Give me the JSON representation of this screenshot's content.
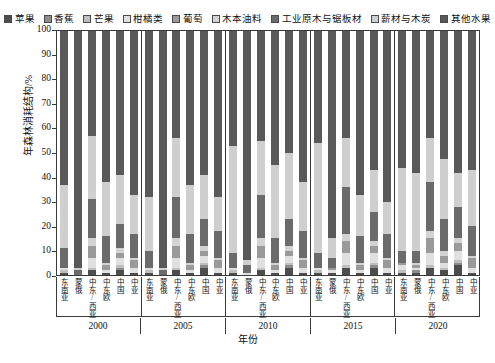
{
  "chart_data": {
    "type": "bar",
    "subtype": "100% stacked column",
    "title": "",
    "xlabel": "年份",
    "ylabel": "年森林消耗结构/%",
    "ylim": [
      0,
      100
    ],
    "yticks": [
      0,
      10,
      20,
      30,
      40,
      50,
      60,
      70,
      80,
      90,
      100
    ],
    "grid": false,
    "legend_position": "top",
    "groups": [
      "2000",
      "2005",
      "2010",
      "2015",
      "2020"
    ],
    "categories": [
      "东南亚",
      "蒙俄",
      "中东/西亚",
      "中东欧",
      "中国",
      "中亚"
    ],
    "series": [
      {
        "name": "苹果",
        "color": "#4d4d4d"
      },
      {
        "name": "香蕉",
        "color": "#8c8c8c"
      },
      {
        "name": "芒果",
        "color": "#bfbfbf"
      },
      {
        "name": "柑橘类",
        "color": "#e0e0e0"
      },
      {
        "name": "葡萄",
        "color": "#9a9a9a"
      },
      {
        "name": "木本油料",
        "color": "#d3d3d3"
      },
      {
        "name": "工业原木与锯板材",
        "color": "#6b6b6b"
      },
      {
        "name": "薪材与木炭",
        "color": "#cfcfcf"
      },
      {
        "name": "其他水果",
        "color": "#595959"
      }
    ],
    "values": {
      "2000": {
        "东南亚": [
          1,
          0,
          1,
          1,
          0,
          0,
          8,
          26,
          63
        ],
        "蒙俄": [
          0,
          0,
          0,
          0,
          0,
          0,
          2,
          1,
          97
        ],
        "中东/西亚": [
          2,
          0,
          1,
          4,
          5,
          3,
          16,
          26,
          43
        ],
        "中东欧": [
          1,
          0,
          0,
          1,
          2,
          1,
          11,
          22,
          62
        ],
        "中国": [
          2,
          1,
          1,
          3,
          2,
          2,
          10,
          20,
          59
        ],
        "中亚": [
          1,
          0,
          0,
          2,
          3,
          1,
          10,
          16,
          67
        ]
      },
      "2005": {
        "东南亚": [
          1,
          0,
          1,
          1,
          0,
          0,
          7,
          22,
          68
        ],
        "蒙俄": [
          0,
          0,
          0,
          0,
          0,
          0,
          2,
          1,
          97
        ],
        "中东/西亚": [
          2,
          0,
          1,
          4,
          5,
          3,
          17,
          24,
          44
        ],
        "中东欧": [
          1,
          0,
          0,
          1,
          2,
          1,
          12,
          20,
          63
        ],
        "中国": [
          3,
          1,
          1,
          3,
          2,
          2,
          11,
          18,
          59
        ],
        "中亚": [
          1,
          0,
          0,
          2,
          3,
          1,
          11,
          14,
          68
        ]
      },
      "2010": {
        "东南亚": [
          1,
          0,
          1,
          1,
          0,
          0,
          6,
          44,
          47
        ],
        "蒙俄": [
          0,
          0,
          0,
          1,
          0,
          0,
          3,
          2,
          94
        ],
        "中东/西亚": [
          2,
          0,
          1,
          4,
          5,
          3,
          18,
          22,
          45
        ],
        "中东欧": [
          1,
          0,
          0,
          1,
          2,
          1,
          10,
          30,
          55
        ],
        "中国": [
          3,
          1,
          1,
          3,
          2,
          2,
          11,
          27,
          50
        ],
        "中亚": [
          1,
          0,
          0,
          2,
          3,
          1,
          11,
          20,
          62
        ]
      },
      "2015": {
        "东南亚": [
          1,
          0,
          1,
          1,
          0,
          0,
          6,
          45,
          46
        ],
        "蒙俄": [
          1,
          0,
          0,
          1,
          1,
          0,
          4,
          8,
          85
        ],
        "中东/西亚": [
          3,
          0,
          1,
          5,
          5,
          3,
          19,
          20,
          44
        ],
        "中东欧": [
          1,
          0,
          0,
          1,
          2,
          1,
          11,
          17,
          67
        ],
        "中国": [
          3,
          1,
          1,
          4,
          3,
          2,
          12,
          17,
          57
        ],
        "中亚": [
          1,
          0,
          0,
          2,
          3,
          1,
          10,
          13,
          70
        ]
      },
      "2020": {
        "东南亚": [
          1,
          0,
          1,
          2,
          1,
          0,
          5,
          34,
          56
        ],
        "蒙俄": [
          1,
          1,
          0,
          1,
          1,
          1,
          5,
          32,
          58
        ],
        "中东/西亚": [
          3,
          0,
          1,
          5,
          6,
          3,
          20,
          18,
          44
        ],
        "中东欧": [
          2,
          0,
          1,
          2,
          3,
          2,
          13,
          25,
          53
        ],
        "中国": [
          4,
          1,
          1,
          4,
          3,
          2,
          13,
          14,
          58
        ],
        "中亚": [
          1,
          0,
          0,
          2,
          4,
          1,
          12,
          23,
          57
        ]
      }
    }
  },
  "legend": {
    "items": [
      {
        "label": "苹果"
      },
      {
        "label": "香蕉"
      },
      {
        "label": "芒果"
      },
      {
        "label": "柑橘类"
      },
      {
        "label": "葡萄"
      },
      {
        "label": "木本油料"
      },
      {
        "label": "工业原木与锯板材"
      },
      {
        "label": "薪材与木炭"
      },
      {
        "label": "其他水果"
      }
    ]
  },
  "axes": {
    "y_title": "年森林消耗结构/%",
    "x_title": "年份"
  }
}
